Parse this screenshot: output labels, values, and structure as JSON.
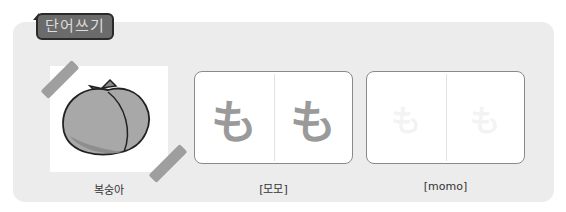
{
  "section": {
    "title": "단어쓰기"
  },
  "word": {
    "picture_icon": "peach-icon",
    "korean_label": "복숭아",
    "trace_card": {
      "characters": [
        "も",
        "も"
      ],
      "reading": "[모모]"
    },
    "blank_card": {
      "faint_characters": [
        "も",
        "も"
      ],
      "romanization": "[momo]"
    }
  },
  "colors": {
    "panel": "#ececec",
    "badge": "#6b6b6b",
    "tape": "#9a9a9a",
    "trace_glyph": "#9a9a9a"
  }
}
